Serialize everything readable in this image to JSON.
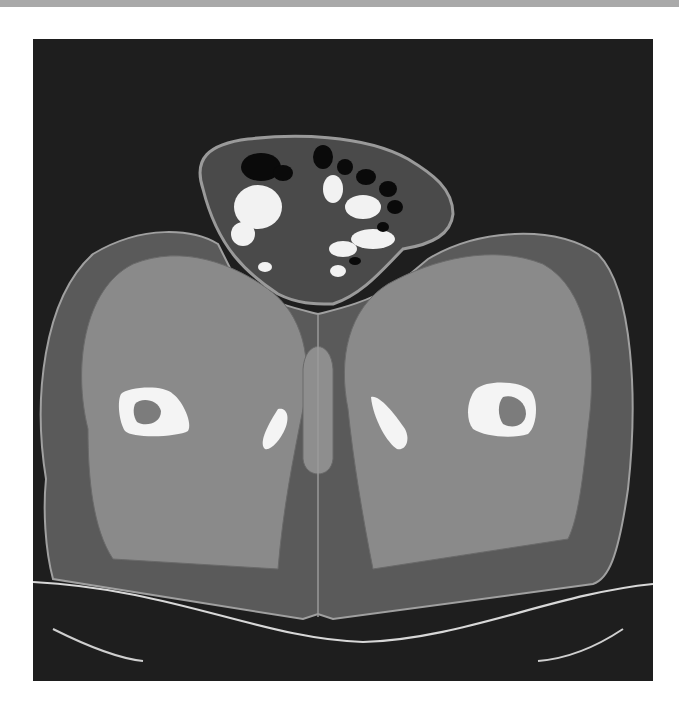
{
  "page": {
    "background": "#ffffff",
    "top_band_color": "#a9a9a9"
  },
  "image": {
    "kind": "axial CT slice (pelvis / upper thighs)",
    "frame": {
      "x": 33,
      "y": 39,
      "width": 620,
      "height": 642,
      "background": "#1e1e1e"
    },
    "colors": {
      "skin_line": "#9a9a9a",
      "fat": "#5a5a5a",
      "muscle": "#8a8a8a",
      "muscle_light": "#929292",
      "bone": "#f4f4f4",
      "marrow": "#7c7c7c",
      "bowel_gas": "#0a0a0a",
      "contrast": "#f2f2f2",
      "mesentery": "#4a4a4a",
      "table": "#d8d8d8"
    },
    "shapes": {
      "body_outline": "M 13 440 C 0 360 10 260 60 215 C 110 185 160 190 185 205 L 205 245 C 240 265 265 270 285 275 C 305 270 330 265 365 245 L 395 220 C 445 190 520 185 565 215 C 600 250 605 360 595 450 C 585 520 575 540 560 545 L 300 580 L 285 575 L 270 580 L 20 540 C 12 510 10 470 13 440 Z",
      "bowel_sac": "M 170 150 C 160 120 175 105 215 100 C 260 95 330 95 375 120 C 400 135 420 150 420 175 C 418 195 400 205 370 210 C 350 230 330 255 300 265 C 280 265 265 265 245 255 C 215 235 185 210 170 150 Z",
      "left_thigh_muscle": "M 55 390 C 40 330 50 250 100 225 C 150 205 200 225 235 250 C 270 275 280 320 270 370 C 260 420 250 470 245 530 L 80 520 C 60 490 55 440 55 390 Z",
      "right_thigh_muscle": "M 315 370 C 305 320 315 270 355 245 C 400 220 460 205 510 225 C 555 250 565 320 555 390 C 550 440 545 480 535 500 L 340 530 C 330 480 320 420 315 370 Z",
      "left_femur": "M 88 355 C 95 348 130 345 140 355 C 150 362 160 385 155 392 C 145 398 100 400 92 392 C 86 383 84 362 88 355 Z",
      "left_femur_marrow": "M 102 365 C 108 358 125 360 128 372 C 128 385 112 388 104 383 C 100 377 100 370 102 365 Z",
      "right_femur": "M 443 350 C 455 340 488 342 498 352 C 506 362 504 388 495 395 C 480 400 452 398 440 390 C 432 380 434 360 443 350 Z",
      "right_femur_marrow": "M 470 358 C 480 355 493 362 493 375 C 492 388 478 390 470 385 C 465 378 464 365 470 358 Z",
      "left_ischium": "M 245 370 C 252 368 258 375 252 390 C 248 400 238 412 232 410 C 226 405 232 390 245 370 Z",
      "right_ischium": "M 338 358 C 345 355 360 372 372 390 C 378 402 372 412 364 410 C 355 405 340 380 338 358 Z",
      "perineum_midline": "M 285 275 L 285 578",
      "scrotum_tissue": "M 270 330 C 272 300 298 300 300 330 L 300 420 C 298 440 272 440 270 420 Z",
      "table_upper": "M 0 543 C 140 550 230 600 330 603 C 430 600 520 555 620 545",
      "table_lower": "M 20 590 C 60 610 90 620 110 622 M 590 590 C 560 610 530 620 505 622"
    },
    "gas_pockets": [
      {
        "cx": 228,
        "cy": 128,
        "rx": 20,
        "ry": 14
      },
      {
        "cx": 250,
        "cy": 134,
        "rx": 10,
        "ry": 8
      },
      {
        "cx": 290,
        "cy": 118,
        "rx": 10,
        "ry": 12
      },
      {
        "cx": 312,
        "cy": 128,
        "rx": 8,
        "ry": 8
      },
      {
        "cx": 333,
        "cy": 138,
        "rx": 10,
        "ry": 8
      },
      {
        "cx": 355,
        "cy": 150,
        "rx": 9,
        "ry": 8
      },
      {
        "cx": 362,
        "cy": 168,
        "rx": 8,
        "ry": 7
      },
      {
        "cx": 350,
        "cy": 188,
        "rx": 6,
        "ry": 5
      },
      {
        "cx": 322,
        "cy": 222,
        "rx": 6,
        "ry": 4
      }
    ],
    "contrast_loops": [
      {
        "cx": 225,
        "cy": 168,
        "rx": 24,
        "ry": 22
      },
      {
        "cx": 210,
        "cy": 195,
        "rx": 12,
        "ry": 12
      },
      {
        "cx": 300,
        "cy": 150,
        "rx": 10,
        "ry": 14
      },
      {
        "cx": 330,
        "cy": 168,
        "rx": 18,
        "ry": 12
      },
      {
        "cx": 340,
        "cy": 200,
        "rx": 22,
        "ry": 10
      },
      {
        "cx": 310,
        "cy": 210,
        "rx": 14,
        "ry": 8
      },
      {
        "cx": 305,
        "cy": 232,
        "rx": 8,
        "ry": 6
      },
      {
        "cx": 232,
        "cy": 228,
        "rx": 7,
        "ry": 5
      }
    ]
  }
}
